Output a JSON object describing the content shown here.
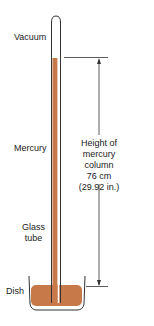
{
  "diagram": {
    "labels": {
      "vacuum": "Vacuum",
      "mercury": "Mercury",
      "glass_tube_line1": "Glass",
      "glass_tube_line2": "tube",
      "dish": "Dish",
      "height_line1": "Height of",
      "height_line2": "mercury",
      "height_line3": "column",
      "height_line4": "76 cm",
      "height_line5": "(29.92 in.)"
    },
    "colors": {
      "mercury": "#c8794a",
      "outline": "#333333",
      "background": "#ffffff"
    }
  }
}
